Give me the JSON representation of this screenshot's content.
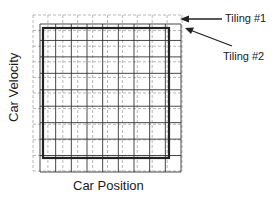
{
  "diagram": {
    "type": "overlapping tile coding grids",
    "xlabel": "Car Position",
    "ylabel": "Car Velocity",
    "callouts": [
      {
        "label": "Tiling #1",
        "target": "outer dotted grid"
      },
      {
        "label": "Tiling #2",
        "target": "offset solid grid"
      }
    ],
    "tiling1": {
      "style": "light dotted",
      "x0": 33,
      "y0": 15,
      "x1": 182,
      "y1": 171,
      "cols": 10,
      "rows": 10,
      "color": "#9a9a9a"
    },
    "tiling2": {
      "style": "solid",
      "x0": 40,
      "y0": 24,
      "x1": 181,
      "y1": 172,
      "border": {
        "x0": 43,
        "y0": 28,
        "x1": 169,
        "y1": 158
      },
      "cols": 9,
      "rows": 9,
      "color": "#333333"
    }
  }
}
